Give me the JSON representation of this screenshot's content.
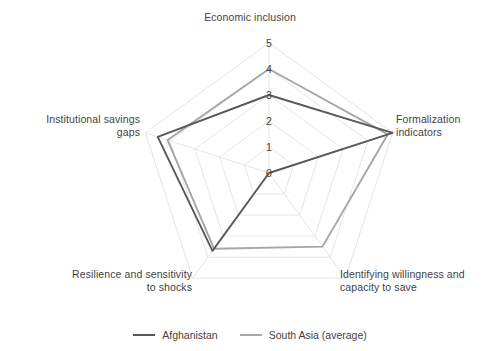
{
  "chart_data": {
    "type": "radar",
    "title": "",
    "categories": [
      "Economic inclusion",
      "Formalization indicators",
      "Identifying willingness and capacity to save",
      "Resilience and sensitivity to shocks",
      "Institutional savings gaps"
    ],
    "series": [
      {
        "name": "Afghanistan",
        "color": "#595959",
        "values": [
          3,
          5,
          0,
          3.7,
          4.5
        ]
      },
      {
        "name": "South Asia (average)",
        "color": "#a6a6a6",
        "values": [
          4,
          4.8,
          3.5,
          3.6,
          4.1
        ]
      }
    ],
    "tick_labels": [
      "0",
      "1",
      "2",
      "3",
      "4",
      "5"
    ],
    "rlim": [
      0,
      5
    ],
    "grid": true,
    "grid_color": "#e2e2e2",
    "legend_position": "bottom"
  },
  "axis_labels": {
    "top": "Economic inclusion",
    "right": "Formalization\nindicators",
    "bottom_right": "Identifying willingness and\ncapacity to save",
    "bottom_left": "Resilience and sensitivity\nto shocks",
    "left": "Institutional savings\ngaps"
  },
  "ticks": [
    {
      "label": "5",
      "x": 269,
      "y": 43
    },
    {
      "label": "4",
      "x": 269,
      "y": 69
    },
    {
      "label": "3",
      "x": 269,
      "y": 95
    },
    {
      "label": "2",
      "x": 269,
      "y": 121
    },
    {
      "label": "1",
      "x": 269,
      "y": 147
    },
    {
      "label": "0",
      "x": 269,
      "y": 173
    }
  ],
  "legend": {
    "items": [
      {
        "label": "Afghanistan",
        "color": "#595959"
      },
      {
        "label": "South Asia (average)",
        "color": "#a6a6a6"
      }
    ]
  }
}
